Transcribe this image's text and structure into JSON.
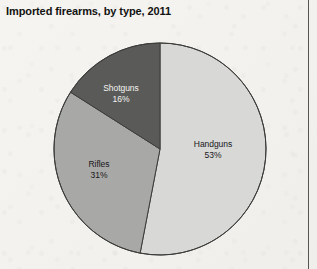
{
  "page": {
    "background_color": "#f2f1ed",
    "rule_color": "#3a3a38"
  },
  "chart_title": "Imported firearms, by type, 2011",
  "chart_data": {
    "type": "pie",
    "title": "Imported firearms, by type, 2011",
    "xlabel": "",
    "ylabel": "",
    "legend_position": "none",
    "labels_inside_slices": true,
    "start_angle_deg": 0,
    "direction": "clockwise",
    "categories": [
      "Handguns",
      "Rifles",
      "Shotguns"
    ],
    "values": [
      53,
      31,
      16
    ],
    "value_unit": "%",
    "colors": [
      "#d8d8d6",
      "#a8a8a6",
      "#5a5a58"
    ],
    "slice_outline_color": "#3c3c3a",
    "slices": [
      {
        "name": "Handguns",
        "value": 53,
        "label": "Handguns",
        "value_label": "53%",
        "color": "#d8d8d6",
        "text_color": "#17171a",
        "start_angle_deg": 0,
        "end_angle_deg": 190.8
      },
      {
        "name": "Rifles",
        "value": 31,
        "label": "Rifles",
        "value_label": "31%",
        "color": "#a8a8a6",
        "text_color": "#17171a",
        "start_angle_deg": 190.8,
        "end_angle_deg": 302.4
      },
      {
        "name": "Shotguns",
        "value": 16,
        "label": "Shotguns",
        "value_label": "16%",
        "color": "#5a5a58",
        "text_color": "#f4f4f2",
        "start_angle_deg": 302.4,
        "end_angle_deg": 360
      }
    ]
  }
}
